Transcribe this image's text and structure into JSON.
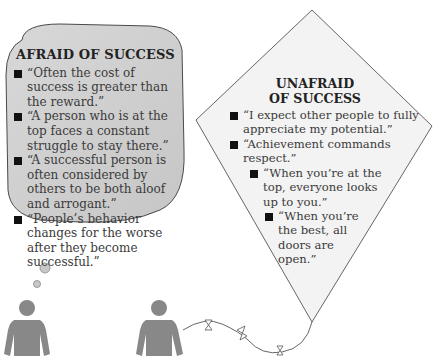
{
  "afraid": {
    "title": "AFRAID OF SUCCESS",
    "items": [
      "“Often the cost of success is greater than the reward.”",
      "“A person who is at the top faces a constant struggle to stay there.”",
      "“A successful person is often considered by others to be both aloof and arrogant.”",
      "“People’s behavior changes for the worse after they become successful.”"
    ]
  },
  "unafraid": {
    "title_line1": "UNAFRAID",
    "title_line2": "OF SUCCESS",
    "items": [
      "“I expect other people to fully appreciate my potential.”",
      "“Achievement commands respect.”",
      "“When you’re at the top, everyone looks up to you.”",
      "“When you’re the best, all doors are open.”"
    ]
  },
  "colors": {
    "bubble_fill": "#cfcfcf",
    "kite_fill": "#f2f2f2",
    "figure": "#8a8a8a",
    "outline": "#555555"
  }
}
